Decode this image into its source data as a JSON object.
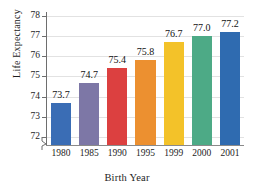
{
  "chart_data": {
    "type": "bar",
    "title": "",
    "xlabel": "Birth Year",
    "ylabel": "Life Expectancy",
    "categories": [
      "1980",
      "1985",
      "1990",
      "1995",
      "1999",
      "2000",
      "2001"
    ],
    "values": [
      73.7,
      74.7,
      75.4,
      75.8,
      76.7,
      77.0,
      77.2
    ],
    "value_labels": [
      "73.7",
      "74.7",
      "75.4",
      "75.8",
      "76.7",
      "77.0",
      "77.2"
    ],
    "ylim": [
      71.6,
      78.2
    ],
    "yticks": [
      72,
      73,
      74,
      75,
      76,
      77,
      78
    ],
    "ytick_labels": [
      "72",
      "73",
      "74",
      "75",
      "76",
      "77",
      "78"
    ],
    "axis_break": true,
    "grid": true,
    "legend": "none",
    "bar_colors": [
      "#3a6db5",
      "#7d77a6",
      "#dc4040",
      "#ec9030",
      "#f3c229",
      "#4daa86",
      "#2f6bb0"
    ]
  }
}
